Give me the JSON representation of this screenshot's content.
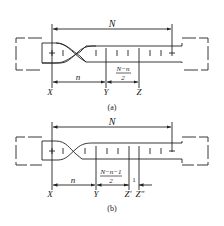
{
  "panels": [
    {
      "caption": "(a)",
      "top_dimension": "N",
      "points": [
        "X",
        "Y",
        "Z"
      ],
      "segments": [
        {
          "label": "n",
          "from": "X",
          "to": "Y"
        },
        {
          "label_num": "N−n",
          "label_den": "2",
          "from": "Y",
          "to": "Z"
        }
      ]
    },
    {
      "caption": "(b)",
      "top_dimension": "N",
      "points": [
        "X",
        "Y",
        "Z'",
        "Z\""
      ],
      "segments": [
        {
          "label": "n",
          "from": "X",
          "to": "Y"
        },
        {
          "label_num": "N−n−1",
          "label_den": "2",
          "from": "Y",
          "to": "Z'"
        },
        {
          "label": "1",
          "from": "Z'",
          "to": "Z\""
        }
      ]
    }
  ],
  "colors": {
    "line": "#222222",
    "background": "#ffffff"
  }
}
